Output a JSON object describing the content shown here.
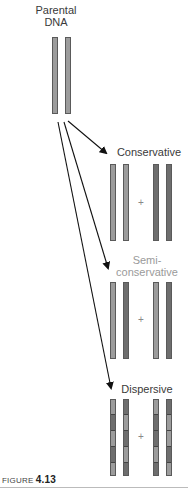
{
  "figure": {
    "parent_label_line1": "Parental",
    "parent_label_line2": "DNA",
    "models": [
      {
        "name": "Conservative",
        "label": "Conservative"
      },
      {
        "name": "Semiconservative",
        "label_line1": "Semi-",
        "label_line2": "conservative"
      },
      {
        "name": "Dispersive",
        "label": "Dispersive"
      }
    ],
    "plus_sign": "+",
    "caption_prefix": "FIGURE ",
    "caption_number": "4.13"
  },
  "colors": {
    "old_strand": "#9c9c9c",
    "new_strand": "#6e6e6e",
    "arrow": "#111111"
  }
}
